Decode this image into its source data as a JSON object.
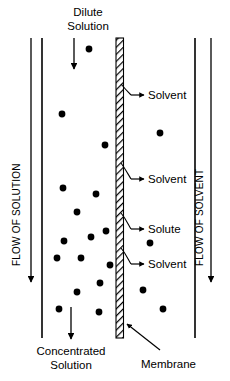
{
  "figure": {
    "kind": "osmosis-membrane-diagram",
    "background_color": "#ffffff",
    "ink_color": "#000000",
    "width": 230,
    "height": 381
  },
  "labels": {
    "top_title_line1": "Dilute",
    "top_title_line2": "Solution",
    "bottom_title_line1": "Concentrated",
    "bottom_title_line2": "Solution",
    "membrane": "Membrane",
    "flow_left": "FLOW OF SOLUTION",
    "flow_right": "FLOW OF SOLVENT",
    "callout_solvent_top": "Solvent",
    "callout_solvent_mid": "Solvent",
    "callout_solute": "Solute",
    "callout_solvent_low": "Solvent"
  },
  "structure": {
    "left_wall_x": 42,
    "right_wall_x": 195,
    "wall_top_y": 38,
    "wall_bottom_y": 338,
    "membrane_left_x": 116,
    "membrane_right_x": 123,
    "membrane_top_y": 38,
    "membrane_bottom_y": 338
  },
  "arrows": {
    "flow_left_arrow": {
      "x": 31,
      "y1": 38,
      "y2": 282
    },
    "flow_right_arrow": {
      "x": 211,
      "y1": 38,
      "y2": 282
    },
    "dilute_inlet_arrow": {
      "x": 74,
      "y1": 38,
      "y2": 70
    },
    "concentrated_outlet_arrow": {
      "x": 71,
      "y1": 307,
      "y2": 340
    }
  },
  "callouts": [
    {
      "name": "solvent-top",
      "text": "Solvent",
      "text_x": 148,
      "text_y": 99,
      "arrow_from_x": 131,
      "arrow_to_x": 144,
      "arrow_y": 95,
      "curve": "M 121 84 C 126 90 128 92 131 95"
    },
    {
      "name": "solvent-mid",
      "text": "Solvent",
      "text_x": 148,
      "text_y": 183,
      "arrow_from_x": 131,
      "arrow_to_x": 144,
      "arrow_y": 179,
      "curve": "M 121 163 C 126 170 128 174 131 179"
    },
    {
      "name": "solute",
      "text": "Solute",
      "text_x": 148,
      "text_y": 233,
      "arrow_from_x": 131,
      "arrow_to_x": 144,
      "arrow_y": 229,
      "curve": "M 121 213 C 126 219 128 224 131 229"
    },
    {
      "name": "solvent-low",
      "text": "Solvent",
      "text_x": 148,
      "text_y": 268,
      "arrow_from_x": 131,
      "arrow_to_x": 144,
      "arrow_y": 264,
      "curve": "M 121 248 C 126 254 128 259 131 264"
    },
    {
      "name": "membrane",
      "text": "Membrane",
      "text_x": 141,
      "text_y": 365,
      "arrow_from_x": 160,
      "arrow_to_x": 125,
      "arrow_y": 350,
      "curve": "M 160 350 L 127 324"
    }
  ],
  "particles": {
    "radius": 3.4,
    "left_chamber": [
      {
        "x": 89,
        "y": 49
      },
      {
        "x": 62,
        "y": 114
      },
      {
        "x": 105,
        "y": 145
      },
      {
        "x": 63,
        "y": 188
      },
      {
        "x": 96,
        "y": 194
      },
      {
        "x": 77,
        "y": 212
      },
      {
        "x": 106,
        "y": 231
      },
      {
        "x": 64,
        "y": 241
      },
      {
        "x": 91,
        "y": 237
      },
      {
        "x": 81,
        "y": 258
      },
      {
        "x": 110,
        "y": 265
      },
      {
        "x": 57,
        "y": 258
      },
      {
        "x": 100,
        "y": 283
      },
      {
        "x": 77,
        "y": 292
      },
      {
        "x": 59,
        "y": 309
      },
      {
        "x": 99,
        "y": 312
      }
    ],
    "right_chamber": [
      {
        "x": 160,
        "y": 133
      },
      {
        "x": 150,
        "y": 243
      },
      {
        "x": 143,
        "y": 290
      },
      {
        "x": 163,
        "y": 309
      }
    ]
  }
}
